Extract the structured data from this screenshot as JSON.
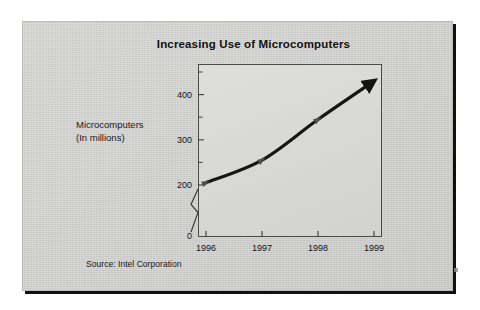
{
  "slide": {
    "title": "Increasing Use of Microcomputers",
    "source_note": "Source: Intel Corporation",
    "y_caption_line1": "Microcomputers",
    "y_caption_line2": "(In millions)",
    "background_color": "#cfcfce",
    "border_color": "#111111",
    "plot_background_color": "#d8d8d6",
    "series_color": "#151515"
  },
  "chart_data": {
    "type": "line",
    "title": "Increasing Use of Microcomputers",
    "xlabel": "",
    "ylabel": "Microcomputers (In millions)",
    "categories": [
      "1996",
      "1997",
      "1998",
      "1999"
    ],
    "x": [
      1996,
      1997,
      1998,
      1999
    ],
    "values": [
      205,
      255,
      345,
      430
    ],
    "series": [
      {
        "name": "Microcomputers (In millions)",
        "values": [
          205,
          255,
          345,
          430
        ]
      }
    ],
    "ylim": [
      0,
      450
    ],
    "y_ticks": [
      "0",
      "200",
      "300",
      "400"
    ],
    "y_tick_values": [
      0,
      200,
      300,
      400
    ],
    "y_minor_ticks": [
      250,
      350,
      450
    ],
    "x_ticks": [
      "1996",
      "1997",
      "1998",
      "1999"
    ],
    "axis_break": true,
    "axis_break_between": [
      0,
      200
    ],
    "grid": false,
    "legend": "none",
    "annotations": [
      "Source: Intel Corporation"
    ],
    "marker_style": "arrowhead",
    "line_end_style": "arrow"
  }
}
